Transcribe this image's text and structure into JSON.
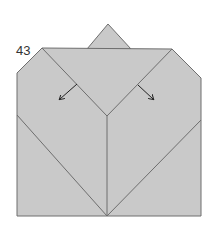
{
  "diagram": {
    "type": "origami-fold-step",
    "step_number": "43",
    "colors": {
      "paper": "#c9c9c9",
      "line": "#6e6e6e",
      "arrow": "#222222",
      "background": "#ffffff"
    },
    "elements": [
      {
        "name": "top-flap-triangle",
        "shape": "triangle"
      },
      {
        "name": "paper-body",
        "shape": "polygon"
      },
      {
        "name": "left-v-fold-line"
      },
      {
        "name": "right-v-fold-line"
      },
      {
        "name": "center-vertical-crease"
      },
      {
        "name": "left-lower-diagonal-crease"
      },
      {
        "name": "right-lower-diagonal-crease"
      },
      {
        "name": "left-fold-arrow",
        "direction": "down-left"
      },
      {
        "name": "right-fold-arrow",
        "direction": "down-right"
      }
    ]
  }
}
